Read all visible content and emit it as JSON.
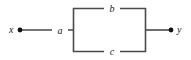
{
  "figure": {
    "type": "signal-flow-block-diagram",
    "title": "",
    "width": 191,
    "height": 60,
    "background_color": "#ffffff",
    "line_color": "#4a4a4a",
    "stroke_width": 1.6,
    "text_color": "#1a1a1a"
  },
  "terminals": [
    {
      "id": "input",
      "label": "x",
      "node_marker": "filled-dot",
      "x": 20,
      "y": 30,
      "label_x": 12,
      "label_y": 30
    },
    {
      "id": "output",
      "label": "y",
      "node_marker": "filled-dot",
      "x": 171,
      "y": 30,
      "label_x": 180,
      "label_y": 30
    }
  ],
  "blocks": [
    {
      "id": "block-a",
      "label": "a",
      "kind": "series-branch",
      "from": "input",
      "to": "parallel-junction-left",
      "label_x": 57,
      "label_y": 30
    },
    {
      "id": "block-b",
      "label": "b",
      "kind": "parallel-branch-top",
      "from": "parallel-junction-left",
      "to": "parallel-junction-right",
      "label_x": 110,
      "label_y": 8
    },
    {
      "id": "block-c",
      "label": "c",
      "kind": "parallel-branch-bottom",
      "from": "parallel-junction-left",
      "to": "parallel-junction-right",
      "label_x": 110,
      "label_y": 52
    }
  ],
  "junctions": [
    {
      "id": "parallel-junction-left",
      "x": 73,
      "y_top": 8,
      "y_bottom": 52,
      "y_mid": 30
    },
    {
      "id": "parallel-junction-right",
      "x": 146,
      "y_top": 8,
      "y_bottom": 52,
      "y_mid": 30
    }
  ],
  "segments": {
    "input_lead": {
      "x1": 20,
      "y1": 30,
      "x2": 73,
      "y2": 30
    },
    "output_lead": {
      "x1": 146,
      "y1": 30,
      "x2": 171,
      "y2": 30
    },
    "left_rail": {
      "x1": 73,
      "y1": 8,
      "x2": 73,
      "y2": 52
    },
    "right_rail": {
      "x1": 146,
      "y1": 8,
      "x2": 146,
      "y2": 52
    },
    "top_rail": {
      "x1": 73,
      "y1": 8,
      "x2": 146,
      "y2": 8
    },
    "bottom_rail": {
      "x1": 73,
      "y1": 52,
      "x2": 146,
      "y2": 52
    }
  }
}
